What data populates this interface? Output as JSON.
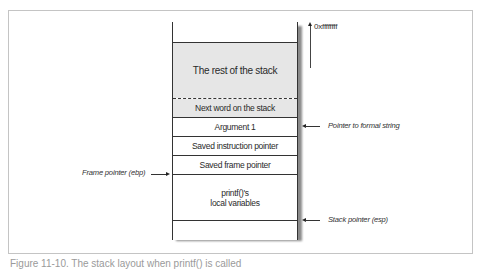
{
  "diagram": {
    "type": "stack-memory-layout",
    "top_address": "0xffffffff",
    "stack_rows": [
      {
        "label": "",
        "shaded": false
      },
      {
        "label": "The rest of the stack",
        "shaded": true
      },
      {
        "label": "Next word on the stack",
        "shaded": true
      },
      {
        "label": "Argument 1",
        "shaded": false
      },
      {
        "label": "Saved instruction pointer",
        "shaded": false
      },
      {
        "label": "Saved frame pointer",
        "shaded": false
      },
      {
        "label_line1": "printf()'s",
        "label_line2": "local variables",
        "shaded": false
      },
      {
        "label": "",
        "shaded": false
      }
    ],
    "annotations": {
      "frame_pointer": "Frame pointer (ebp)",
      "format_string_pointer": "Pointer to formal string",
      "stack_pointer": "Stack pointer (esp)"
    },
    "colors": {
      "shaded_fill": "#e6e6e6",
      "line": "#333333",
      "frame_border": "#c4c4c4",
      "shadow": "#8a8a8a"
    }
  },
  "caption": "Figure 11-10. The stack layout when printf() is called"
}
